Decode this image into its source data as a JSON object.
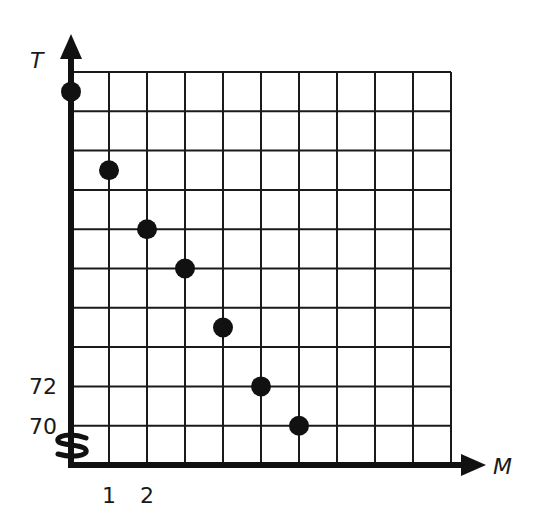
{
  "chart_data": {
    "type": "scatter",
    "title": "",
    "xlabel": "M",
    "ylabel": "T",
    "x": [
      0,
      1,
      2,
      3,
      4,
      5,
      6
    ],
    "series": [
      {
        "name": "T vs M",
        "values": [
          87,
          83,
          80,
          78,
          75,
          72,
          70
        ]
      }
    ],
    "x_tick_labels": [
      "1",
      "2"
    ],
    "y_tick_labels": [
      "70",
      "72"
    ],
    "xlim": [
      0,
      10
    ],
    "ylim": [
      68,
      88
    ],
    "y_axis_break": true,
    "grid": true,
    "grid_columns": 10,
    "grid_rows": 10,
    "x_step": 1,
    "y_step": 2,
    "legend": "none"
  },
  "colors": {
    "ink": "#111111",
    "grid": "#1a1a1a",
    "background": "#ffffff"
  }
}
